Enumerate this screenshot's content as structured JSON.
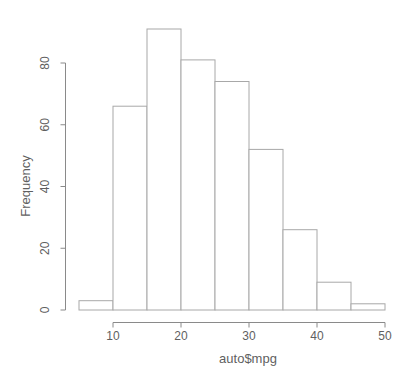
{
  "chart_data": {
    "type": "bar",
    "subtype": "histogram",
    "title": "",
    "xlabel": "auto$mpg",
    "ylabel": "Frequency",
    "bin_edges": [
      5,
      10,
      15,
      20,
      25,
      30,
      35,
      40,
      45,
      50
    ],
    "categories": [
      "5-10",
      "10-15",
      "15-20",
      "20-25",
      "25-30",
      "30-35",
      "35-40",
      "40-45",
      "45-50"
    ],
    "values": [
      3,
      66,
      91,
      81,
      74,
      52,
      26,
      9,
      2
    ],
    "x_ticks": [
      10,
      20,
      30,
      40,
      50
    ],
    "y_ticks": [
      0,
      20,
      40,
      60,
      80
    ],
    "xlim": [
      5,
      50
    ],
    "ylim": [
      0,
      80
    ],
    "grid": false,
    "legend": "none",
    "colors": {
      "background": "#ffffff",
      "bar_fill": "#ffffff",
      "bar_border": "#a8a8a8",
      "axis": "#8a8a8a",
      "text": "#5f5f5f"
    }
  }
}
